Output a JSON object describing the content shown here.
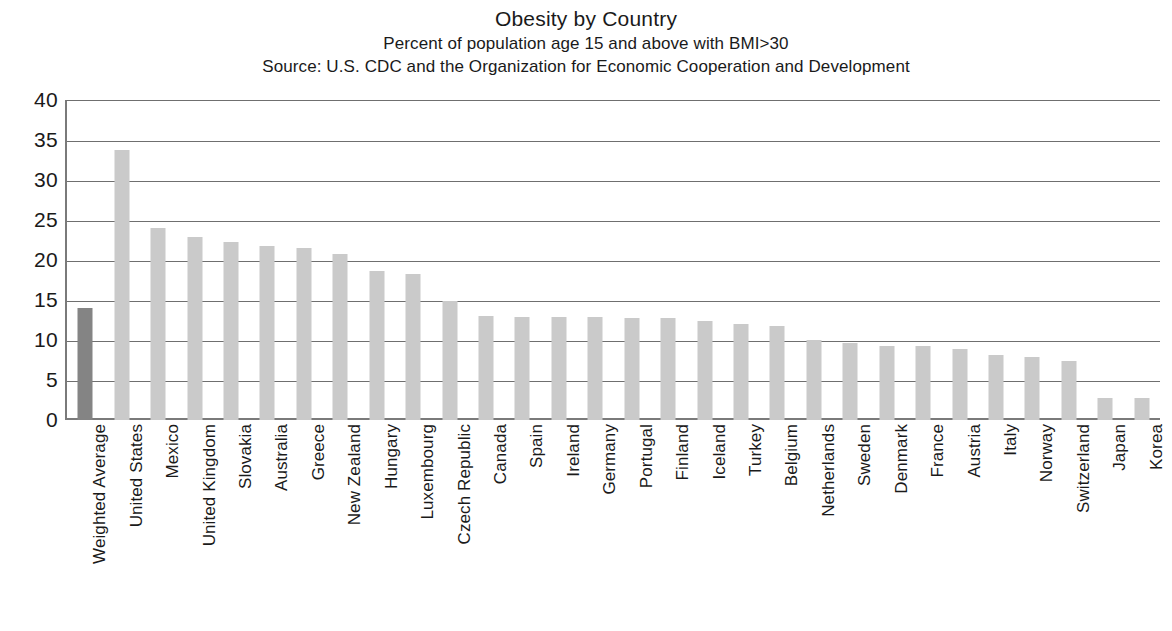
{
  "chart_data": {
    "type": "bar",
    "title": "Obesity by Country",
    "subtitle": "Percent of population age 15 and above with BMI>30",
    "source": "Source: U.S. CDC and the Organization for Economic Cooperation and Development",
    "xlabel": "",
    "ylabel": "",
    "ylim": [
      0,
      40
    ],
    "ytick_step": 5,
    "yticks": [
      "40",
      "35",
      "30",
      "25",
      "20",
      "15",
      "10",
      "5",
      "0"
    ],
    "grid": true,
    "legend": "none",
    "orientation": "vertical",
    "highlight_color": "#848484",
    "bar_color": "#cacaca",
    "categories": [
      "Weighted Average",
      "United States",
      "Mexico",
      "United Kingdom",
      "Slovakia",
      "Australia",
      "Greece",
      "New Zealand",
      "Hungary",
      "Luxembourg",
      "Czech Republic",
      "Canada",
      "Spain",
      "Ireland",
      "Germany",
      "Portugal",
      "Finland",
      "Iceland",
      "Turkey",
      "Belgium",
      "Netherlands",
      "Sweden",
      "Denmark",
      "France",
      "Austria",
      "Italy",
      "Norway",
      "Switzerland",
      "Japan",
      "Korea"
    ],
    "values": [
      14.0,
      33.8,
      24.0,
      22.9,
      22.2,
      21.7,
      21.5,
      20.8,
      18.6,
      18.3,
      14.9,
      13.0,
      12.9,
      12.9,
      12.9,
      12.8,
      12.8,
      12.4,
      12.0,
      11.7,
      10.0,
      9.6,
      9.2,
      9.2,
      8.9,
      8.1,
      7.9,
      7.4,
      2.8,
      2.8
    ],
    "highlight_index": 0
  }
}
